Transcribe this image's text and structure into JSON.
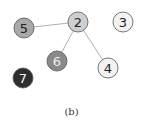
{
  "figure": {
    "caption": "(b)",
    "nodes": [
      {
        "id": "5",
        "label": "5",
        "x": 24,
        "y": 28,
        "fill": "#a9a9a9",
        "text": "#222222"
      },
      {
        "id": "2",
        "label": "2",
        "x": 78,
        "y": 22,
        "fill": "#cfcfcf",
        "text": "#222222"
      },
      {
        "id": "3",
        "label": "3",
        "x": 123,
        "y": 22,
        "fill": "#f3f3f3",
        "text": "#222222"
      },
      {
        "id": "6",
        "label": "6",
        "x": 57,
        "y": 61,
        "fill": "#8a8a8a",
        "text": "#f0f0f0"
      },
      {
        "id": "4",
        "label": "4",
        "x": 108,
        "y": 68,
        "fill": "#f3f3f3",
        "text": "#222222"
      },
      {
        "id": "7",
        "label": "7",
        "x": 23,
        "y": 78,
        "fill": "#2e2e2e",
        "text": "#f5f5f5"
      }
    ],
    "edges": [
      {
        "from": "5",
        "to": "2"
      },
      {
        "from": "2",
        "to": "6"
      },
      {
        "from": "2",
        "to": "4"
      }
    ]
  }
}
